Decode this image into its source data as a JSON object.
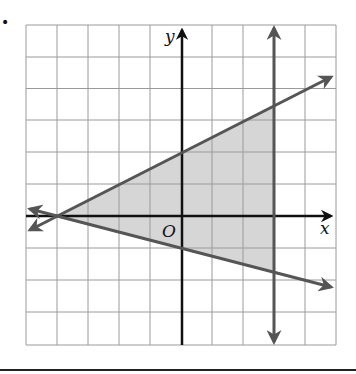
{
  "figure": {
    "bullet": "•",
    "axis_labels": {
      "x": "x",
      "y": "y",
      "origin": "O"
    },
    "grid": {
      "x_min": -5,
      "x_max": 5,
      "y_min": -4,
      "y_max": 6,
      "step": 1
    },
    "colors": {
      "grid": "#9a9a9a",
      "axes": "#111111",
      "boundary_lines": "#555555",
      "shaded_region": "#d6d6d6",
      "background": "#ffffff"
    },
    "boundary_lines": [
      {
        "name": "upper-line",
        "equation": "y = 0.5x + 2",
        "slope": 0.5,
        "intercept": 2
      },
      {
        "name": "lower-line",
        "equation": "y = -0.25x - 1",
        "slope": -0.25,
        "intercept": -1
      },
      {
        "name": "vertical-line",
        "equation": "x = 3"
      }
    ],
    "shaded_region": {
      "description": "Triangle bounded by y = 0.5x + 2, y = -0.25x - 1, and x = 3",
      "vertices": [
        [
          -4,
          0
        ],
        [
          3,
          3.5
        ],
        [
          3,
          -1.75
        ]
      ]
    }
  }
}
